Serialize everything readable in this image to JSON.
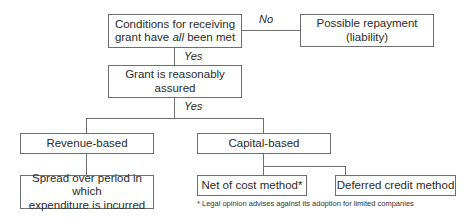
{
  "diagram": {
    "nodes": {
      "conditions": {
        "line1": "Conditions for receiving",
        "line2_pre": "grant have ",
        "line2_em": "all",
        "line2_post": " been met"
      },
      "repayment": {
        "line1": "Possible repayment",
        "line2": "(liability)"
      },
      "assured": {
        "line1": "Grant is reasonably",
        "line2": "assured"
      },
      "revenue": {
        "label": "Revenue-based"
      },
      "capital": {
        "label": "Capital-based"
      },
      "spread": {
        "line1": "Spread over period in which",
        "line2": "expenditure is incurred"
      },
      "net_cost": {
        "label": "Net of cost method*"
      },
      "deferred": {
        "label": "Deferred credit method"
      }
    },
    "edges": {
      "no_label": "No",
      "yes1_label": "Yes",
      "yes2_label": "Yes"
    },
    "footnote": "* Legal opinion advises against its adoption for limited companies"
  }
}
